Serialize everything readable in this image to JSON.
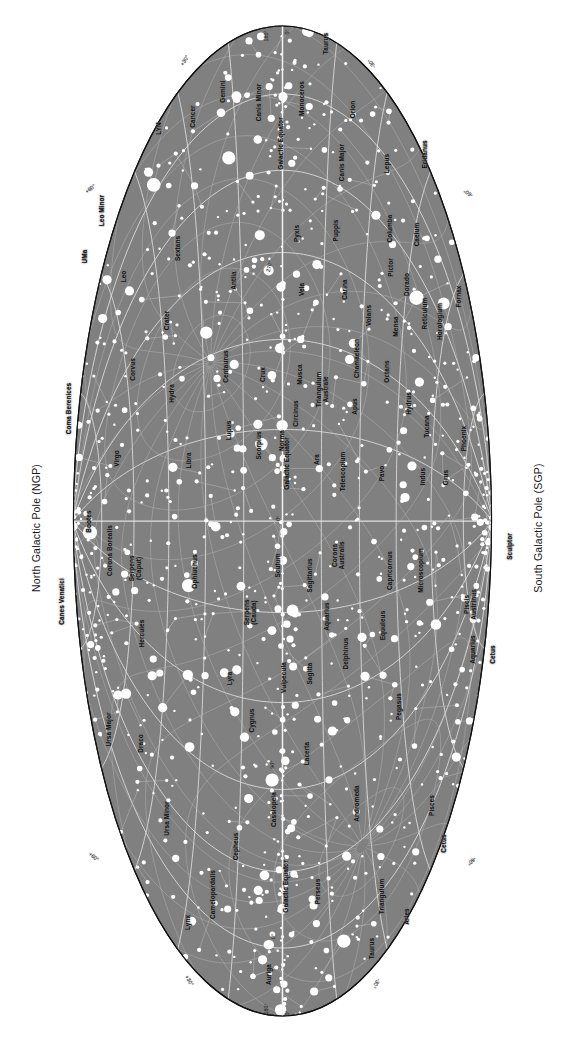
{
  "chart_data": {
    "type": "scatter",
    "projection": "aitoff-hammer",
    "orientation": "rotated-90-clockwise",
    "background_color": "#808080",
    "page_color": "#ffffff",
    "grid_color": "#e8e8e8",
    "star_color": "#ffffff",
    "constellation_line_color": "#c9c9c9",
    "text_color": "#111111",
    "xlabel": "Galactic longitude",
    "ylabel": "Galactic latitude",
    "xlim": [
      0,
      360
    ],
    "ylim": [
      -90,
      90
    ],
    "grid": true,
    "grid_longitude_step": 30,
    "grid_latitude_step": 15,
    "legend": "none",
    "pole_labels": {
      "north": "North Galactic Pole (NGP)",
      "south": "South Galactic Pole (SGP)"
    },
    "equator_labels": [
      "Galactic Equator",
      "Galactic Equator",
      "Galactic Equator"
    ],
    "longitude_ticks": [
      {
        "label": "0°",
        "lon": 0
      },
      {
        "label": "90°",
        "lon": 90
      },
      {
        "label": "180°",
        "lon": 180
      },
      {
        "label": "270°",
        "lon": 270
      },
      {
        "label": "0°",
        "lon": 360
      }
    ],
    "latitude_ticks_left": [
      "+30°",
      "+60°",
      "+60°",
      "+30°"
    ],
    "latitude_ticks_right": [
      "-30°",
      "-60°",
      "-60°",
      "-30°"
    ],
    "edge_ticks": [
      {
        "label": "180°",
        "x": 269,
        "y": 33,
        "rot": -90
      },
      {
        "label": "0°",
        "x": 290,
        "y": 29,
        "rot": -90
      },
      {
        "label": "180°",
        "x": 269,
        "y": 1006,
        "rot": -90
      },
      {
        "label": "0°",
        "x": 290,
        "y": 1010,
        "rot": -90
      },
      {
        "label": "+30°",
        "x": 187,
        "y": 59,
        "rot": -58
      },
      {
        "label": "+60°",
        "x": 92,
        "y": 188,
        "rot": -38
      },
      {
        "label": "+60°",
        "x": 92,
        "y": 856,
        "rot": 38
      },
      {
        "label": "+30°",
        "x": 187,
        "y": 979,
        "rot": 58
      },
      {
        "label": "-30°",
        "x": 374,
        "y": 59,
        "rot": -122
      },
      {
        "label": "-60°",
        "x": 470,
        "y": 188,
        "rot": -142
      },
      {
        "label": "-60°",
        "x": 470,
        "y": 856,
        "rot": 142
      },
      {
        "label": "-30°",
        "x": 374,
        "y": 979,
        "rot": 122
      }
    ],
    "inner_ticks": [
      {
        "label": "270°",
        "x": 272,
        "y": 264,
        "rot": -78
      },
      {
        "label": "0°",
        "x": 281,
        "y": 516,
        "rot": -80
      },
      {
        "label": "90°",
        "x": 275,
        "y": 762,
        "rot": -82
      },
      {
        "label": "0°",
        "x": 276,
        "y": 934,
        "rot": -84
      }
    ],
    "constellations": [
      {
        "name": "Taurus",
        "x": 329,
        "y": 40,
        "rot": -90
      },
      {
        "name": "Orion",
        "x": 356,
        "y": 106,
        "rot": -90
      },
      {
        "name": "Monoceros",
        "x": 305,
        "y": 95,
        "rot": -90
      },
      {
        "name": "Gemini",
        "x": 226,
        "y": 88,
        "rot": -90
      },
      {
        "name": "Canis Minor",
        "x": 262,
        "y": 99,
        "rot": -90
      },
      {
        "name": "Cancer",
        "x": 196,
        "y": 113,
        "rot": -90
      },
      {
        "name": "LYN",
        "x": 162,
        "y": 125,
        "rot": -90
      },
      {
        "name": "Canis Major",
        "x": 345,
        "y": 159,
        "rot": -90
      },
      {
        "name": "Lepus",
        "x": 390,
        "y": 160,
        "rot": -90
      },
      {
        "name": "Eridanus",
        "x": 428,
        "y": 151,
        "rot": -90
      },
      {
        "name": "Columba",
        "x": 393,
        "y": 225,
        "rot": -90
      },
      {
        "name": "Caelum",
        "x": 420,
        "y": 231,
        "rot": -90
      },
      {
        "name": "Puppis",
        "x": 339,
        "y": 227,
        "rot": -90
      },
      {
        "name": "Pyxis",
        "x": 300,
        "y": 230,
        "rot": -90
      },
      {
        "name": "Vela",
        "x": 305,
        "y": 286,
        "rot": -90
      },
      {
        "name": "Carina",
        "x": 348,
        "y": 286,
        "rot": -90
      },
      {
        "name": "Pictor",
        "x": 394,
        "y": 264,
        "rot": -90
      },
      {
        "name": "Dorado",
        "x": 410,
        "y": 281,
        "rot": -90
      },
      {
        "name": "Volans",
        "x": 372,
        "y": 312,
        "rot": -90
      },
      {
        "name": "Mensa",
        "x": 399,
        "y": 323,
        "rot": -90
      },
      {
        "name": "Reticulum",
        "x": 428,
        "y": 310,
        "rot": -90
      },
      {
        "name": "Horologium",
        "x": 443,
        "y": 318,
        "rot": -90
      },
      {
        "name": "Fornax",
        "x": 462,
        "y": 293,
        "rot": -90
      },
      {
        "name": "Antlia",
        "x": 237,
        "y": 277,
        "rot": -90
      },
      {
        "name": "Hydra",
        "x": 175,
        "y": 390,
        "rot": -90
      },
      {
        "name": "Sextans",
        "x": 181,
        "y": 245,
        "rot": -90
      },
      {
        "name": "Leo",
        "x": 127,
        "y": 273,
        "rot": -90
      },
      {
        "name": "Leo Minor",
        "x": 105,
        "y": 207,
        "rot": -90
      },
      {
        "name": "UMa",
        "x": 88,
        "y": 253,
        "rot": -90
      },
      {
        "name": "Crater",
        "x": 170,
        "y": 317,
        "rot": -90
      },
      {
        "name": "Corvus",
        "x": 136,
        "y": 366,
        "rot": -90
      },
      {
        "name": "Centaurus",
        "x": 229,
        "y": 363,
        "rot": -90
      },
      {
        "name": "Crux",
        "x": 266,
        "y": 371,
        "rot": -90
      },
      {
        "name": "Musca",
        "x": 303,
        "y": 371,
        "rot": -90
      },
      {
        "name": "Circinus",
        "x": 299,
        "y": 410,
        "rot": -90
      },
      {
        "name": "Triangulum\nAustrale",
        "x": 330,
        "y": 382,
        "rot": -90
      },
      {
        "name": "Apus",
        "x": 358,
        "y": 403,
        "rot": -90
      },
      {
        "name": "Chamaeleon",
        "x": 360,
        "y": 355,
        "rot": -90
      },
      {
        "name": "Octans",
        "x": 390,
        "y": 368,
        "rot": -90
      },
      {
        "name": "Hydrus",
        "x": 412,
        "y": 400,
        "rot": -90
      },
      {
        "name": "Tucana",
        "x": 430,
        "y": 423,
        "rot": -90
      },
      {
        "name": "Phoenix",
        "x": 467,
        "y": 435,
        "rot": -90
      },
      {
        "name": "Grus",
        "x": 449,
        "y": 474,
        "rot": -90
      },
      {
        "name": "Indus",
        "x": 426,
        "y": 473,
        "rot": -90
      },
      {
        "name": "Pavo",
        "x": 385,
        "y": 470,
        "rot": -90
      },
      {
        "name": "Telescopium",
        "x": 346,
        "y": 468,
        "rot": -90
      },
      {
        "name": "Ara",
        "x": 320,
        "y": 456,
        "rot": -90
      },
      {
        "name": "Norma",
        "x": 285,
        "y": 437,
        "rot": -90
      },
      {
        "name": "Scorpius",
        "x": 262,
        "y": 442,
        "rot": -90
      },
      {
        "name": "Lupus",
        "x": 232,
        "y": 427,
        "rot": -90
      },
      {
        "name": "Libra",
        "x": 192,
        "y": 457,
        "rot": -90
      },
      {
        "name": "Virgo",
        "x": 120,
        "y": 455,
        "rot": -90
      },
      {
        "name": "Coma Berenices",
        "x": 72,
        "y": 405,
        "rot": -90
      },
      {
        "name": "Canes Venatici",
        "x": 65,
        "y": 598,
        "rot": -90
      },
      {
        "name": "Bootes",
        "x": 92,
        "y": 518,
        "rot": -90
      },
      {
        "name": "Corona Borealis",
        "x": 113,
        "y": 547,
        "rot": -90
      },
      {
        "name": "Serpens\n(Caput)",
        "x": 143,
        "y": 561,
        "rot": -90
      },
      {
        "name": "Ophiuchus",
        "x": 198,
        "y": 568,
        "rot": -90
      },
      {
        "name": "Serpens\n(Cauda)",
        "x": 258,
        "y": 605,
        "rot": -90
      },
      {
        "name": "Scutum",
        "x": 281,
        "y": 562,
        "rot": -90
      },
      {
        "name": "Sagittarius",
        "x": 313,
        "y": 572,
        "rot": -90
      },
      {
        "name": "Corona\nAustralis",
        "x": 346,
        "y": 548,
        "rot": -90
      },
      {
        "name": "Capricornus",
        "x": 393,
        "y": 567,
        "rot": -90
      },
      {
        "name": "Microscopium",
        "x": 424,
        "y": 567,
        "rot": -90
      },
      {
        "name": "Sculptor",
        "x": 513,
        "y": 543,
        "rot": -90
      },
      {
        "name": "Piscis\nAustrinus",
        "x": 478,
        "y": 597,
        "rot": -90
      },
      {
        "name": "Cetus",
        "x": 496,
        "y": 651,
        "rot": -90
      },
      {
        "name": "Aquarius",
        "x": 330,
        "y": 613,
        "rot": -90
      },
      {
        "name": "Aquarius",
        "x": 476,
        "y": 646,
        "rot": -90
      },
      {
        "name": "Equuleus",
        "x": 386,
        "y": 622,
        "rot": -90
      },
      {
        "name": "Delphinus",
        "x": 349,
        "y": 650,
        "rot": -90
      },
      {
        "name": "Sagitta",
        "x": 313,
        "y": 670,
        "rot": -90
      },
      {
        "name": "Vulpecula",
        "x": 287,
        "y": 674,
        "rot": -90
      },
      {
        "name": "Lyra",
        "x": 233,
        "y": 675,
        "rot": -90
      },
      {
        "name": "Hercules",
        "x": 145,
        "y": 630,
        "rot": -90
      },
      {
        "name": "Cygnus",
        "x": 255,
        "y": 717,
        "rot": -90
      },
      {
        "name": "Pegasus",
        "x": 402,
        "y": 703,
        "rot": -90
      },
      {
        "name": "Lacerta",
        "x": 310,
        "y": 750,
        "rot": -90
      },
      {
        "name": "Pisces",
        "x": 435,
        "y": 802,
        "rot": -90
      },
      {
        "name": "Cetus",
        "x": 447,
        "y": 840,
        "rot": -90
      },
      {
        "name": "Andromeda",
        "x": 360,
        "y": 800,
        "rot": -90
      },
      {
        "name": "Cassiopeia",
        "x": 277,
        "y": 806,
        "rot": -90
      },
      {
        "name": "Cepheus",
        "x": 239,
        "y": 843,
        "rot": -90
      },
      {
        "name": "Camelopardalis",
        "x": 216,
        "y": 891,
        "rot": -90
      },
      {
        "name": "Lynx",
        "x": 191,
        "y": 919,
        "rot": -90
      },
      {
        "name": "Draco",
        "x": 144,
        "y": 740,
        "rot": -90
      },
      {
        "name": "Ursa Major",
        "x": 112,
        "y": 726,
        "rot": -90
      },
      {
        "name": "Ursa Minor",
        "x": 170,
        "y": 815,
        "rot": -90
      },
      {
        "name": "Triangulum",
        "x": 385,
        "y": 893,
        "rot": -90
      },
      {
        "name": "Perseus",
        "x": 321,
        "y": 888,
        "rot": -90
      },
      {
        "name": "Taurus",
        "x": 375,
        "y": 945,
        "rot": -90
      },
      {
        "name": "Aries",
        "x": 410,
        "y": 913,
        "rot": -90
      },
      {
        "name": "Auriga",
        "x": 272,
        "y": 971,
        "rot": -90
      }
    ],
    "galactic_equator_labels": [
      {
        "label": "Galactic Equator",
        "x": 284,
        "y": 140,
        "rot": -90
      },
      {
        "label": "Galactic Equator",
        "x": 290,
        "y": 460,
        "rot": -90
      },
      {
        "label": "Galactic Equator",
        "x": 289,
        "y": 883,
        "rot": -90
      }
    ],
    "star_magnitude_sizes": [
      6.0,
      4.6,
      3.6,
      2.8,
      2.1,
      1.6,
      1.2
    ],
    "star_count_approx": 1100,
    "ellipse": {
      "cx": 282.5,
      "cy": 521,
      "rx": 210,
      "ry": 496
    }
  }
}
